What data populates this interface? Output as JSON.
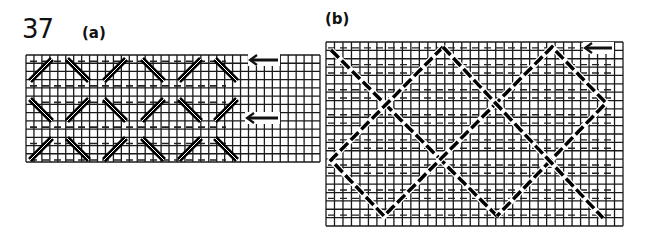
{
  "figure": {
    "number": "37",
    "panels": [
      {
        "label": "(a)",
        "description": "Needlepoint canvas grid with 3 rows x 6 columns of double diagonal slanted stitches alternating direction, horizontal dashed tramming lines, and two left-pointing arrows",
        "grid": {
          "x": 26,
          "y": 55,
          "width": 294,
          "height": 107,
          "cell": 8
        },
        "stitch_rows": [
          [
            "/",
            "\\",
            "/",
            "\\",
            "/",
            "\\"
          ],
          [
            "\\",
            "/",
            "\\",
            "/",
            "\\",
            "/"
          ],
          [
            "/",
            "\\",
            "/",
            "\\",
            "/",
            "\\"
          ]
        ],
        "stitch_centers_x": [
          41,
          78,
          115,
          153,
          190,
          226
        ],
        "stitch_centers_y": [
          70,
          110,
          149
        ],
        "arrows": [
          {
            "direction": "left",
            "x1": 278,
            "x2": 250,
            "y": 60
          },
          {
            "direction": "left",
            "x1": 278,
            "x2": 247,
            "y": 118
          }
        ]
      },
      {
        "label": "(b)",
        "description": "Needlepoint canvas grid with a diagonal diamond lattice of long dashed stitches crossing over horizontal dashed tramming lines, with one left-pointing arrow",
        "grid": {
          "x": 326,
          "y": 42,
          "width": 297,
          "height": 184,
          "cell": 8.5
        },
        "lattice_paths": [
          [
            [
              331,
              50
            ],
            [
              497,
              216
            ]
          ],
          [
            [
              443,
              47
            ],
            [
              331,
              160
            ],
            [
              384,
              216
            ],
            [
              552,
              47
            ],
            [
              606,
              103
            ],
            [
              497,
              216
            ]
          ],
          [
            [
              443,
              47
            ],
            [
              603,
              218
            ]
          ]
        ],
        "arrows": [
          {
            "direction": "left",
            "x1": 612,
            "x2": 585,
            "y": 48
          }
        ]
      }
    ]
  }
}
